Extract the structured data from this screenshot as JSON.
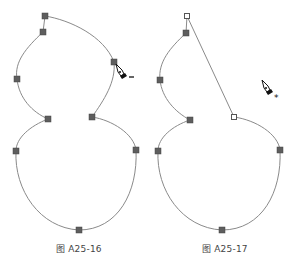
{
  "figures": [
    {
      "caption": "图 A25-16",
      "cursor": {
        "icon": "pen-minus-icon",
        "modifier": "−"
      }
    },
    {
      "caption": "图 A25-17",
      "cursor": {
        "icon": "pen-star-icon",
        "modifier": "*"
      }
    }
  ],
  "colors": {
    "path_stroke": "#8a8a8a",
    "anchor_fill": "#5e5e5e",
    "background": "#ffffff"
  }
}
